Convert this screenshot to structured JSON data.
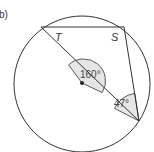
{
  "part_label": "b)",
  "diagram": {
    "type": "circle-theorem",
    "circle": {
      "cx": 82,
      "cy": 84,
      "r": 68
    },
    "points": {
      "A": {
        "x": 41,
        "y": 27
      },
      "S": {
        "x": 124,
        "y": 27
      },
      "B": {
        "x": 139,
        "y": 121
      },
      "O": {
        "x": 82,
        "y": 83
      }
    },
    "labels": {
      "T": "T",
      "S": "S",
      "center_angle": "160°",
      "edge_angle": "47°"
    },
    "colors": {
      "stroke": "#333333",
      "angle_fill": "#e6e6e6"
    }
  }
}
